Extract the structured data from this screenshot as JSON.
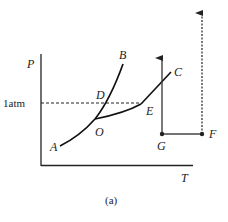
{
  "diagram": {
    "type": "phase-diagram",
    "caption": "(a)",
    "axes": {
      "y_label": "P",
      "x_label": "T"
    },
    "reference_line": {
      "label": "1atm",
      "style": "dashed"
    },
    "points": {
      "A": "A",
      "B": "B",
      "C": "C",
      "D": "D",
      "E": "E",
      "O": "O",
      "G": "G",
      "F": "F"
    },
    "curves": [
      {
        "name": "OA",
        "from": "O",
        "to": "A"
      },
      {
        "name": "OB",
        "from": "O",
        "to": "B"
      },
      {
        "name": "OE",
        "from": "O",
        "to": "E"
      },
      {
        "name": "EC",
        "from": "E",
        "to": "C"
      }
    ],
    "paths": [
      {
        "name": "G-up",
        "from": "G",
        "style": "solid-arrow",
        "direction": "up"
      },
      {
        "name": "GF",
        "from": "G",
        "to": "F",
        "style": "solid"
      },
      {
        "name": "F-up",
        "from": "F",
        "style": "dashed-arrow",
        "direction": "up"
      }
    ],
    "colors": {
      "ink": "#222222",
      "background": "#ffffff"
    }
  }
}
